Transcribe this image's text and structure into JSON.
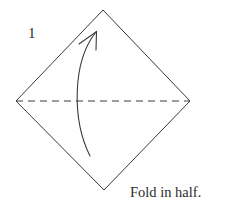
{
  "figure": {
    "step_number": "1",
    "caption": "Fold in half.",
    "colors": {
      "stroke": "#3a3a3a",
      "background": "#ffffff",
      "text": "#2b2b2b"
    },
    "shape": {
      "name": "square-rotated-diamond",
      "vertices": {
        "top": {
          "x": 103,
          "y": 10
        },
        "right": {
          "x": 190,
          "y": 101
        },
        "bottom": {
          "x": 104,
          "y": 190
        },
        "left": {
          "x": 16,
          "y": 101
        }
      },
      "stroke_width": 1
    },
    "fold_line": {
      "name": "horizontal-fold-crease",
      "style": "dashed",
      "from": {
        "x": 16,
        "y": 101
      },
      "to": {
        "x": 190,
        "y": 101
      },
      "dash_length": 7,
      "gap_length": 5,
      "stroke_width": 1
    },
    "fold_arrow": {
      "name": "upward-fold-arrow",
      "direction": "up",
      "tail": {
        "x": 90,
        "y": 156
      },
      "tip": {
        "x": 96,
        "y": 32
      },
      "curve_control_1": {
        "x": 72,
        "y": 120
      },
      "curve_control_2": {
        "x": 72,
        "y": 62
      },
      "arrowhead": {
        "left_barb": {
          "x": 79,
          "y": 44
        },
        "right_barb": {
          "x": 96,
          "y": 50
        }
      },
      "stroke_width": 1
    }
  }
}
